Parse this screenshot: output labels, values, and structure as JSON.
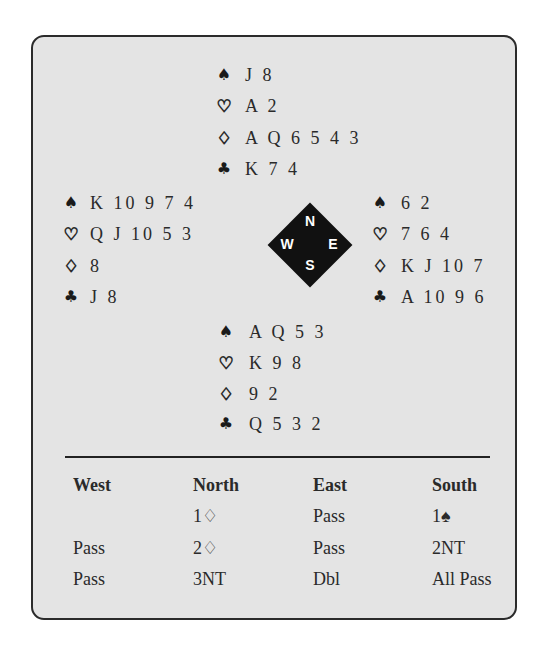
{
  "deal": {
    "north": {
      "spades": "J 8",
      "hearts": "A 2",
      "diamonds": "A Q 6 5 4 3",
      "clubs": "K 7 4"
    },
    "west": {
      "spades": "K 10 9 7 4",
      "hearts": "Q J 10 5 3",
      "diamonds": "8",
      "clubs": "J 8"
    },
    "east": {
      "spades": "6 2",
      "hearts": "7 6 4",
      "diamonds": "K J 10 7",
      "clubs": "A 10 9 6"
    },
    "south": {
      "spades": "A Q 5 3",
      "hearts": "K 9 8",
      "diamonds": "9 2",
      "clubs": "Q 5 3 2"
    }
  },
  "suit_symbols": {
    "spades": "♠",
    "hearts": "♡",
    "diamonds": "♢",
    "clubs": "♣"
  },
  "compass": {
    "n": "N",
    "e": "E",
    "s": "S",
    "w": "W"
  },
  "auction": {
    "headers": [
      "West",
      "North",
      "East",
      "South"
    ],
    "rows": [
      [
        "",
        "1♢",
        "Pass",
        "1♠"
      ],
      [
        "Pass",
        "2♢",
        "Pass",
        "2NT"
      ],
      [
        "Pass",
        "3NT",
        "Dbl",
        "All Pass"
      ]
    ]
  },
  "colors": {
    "background": "#e4e4e4",
    "border": "#2b2b2b",
    "text": "#2a2a2a"
  }
}
